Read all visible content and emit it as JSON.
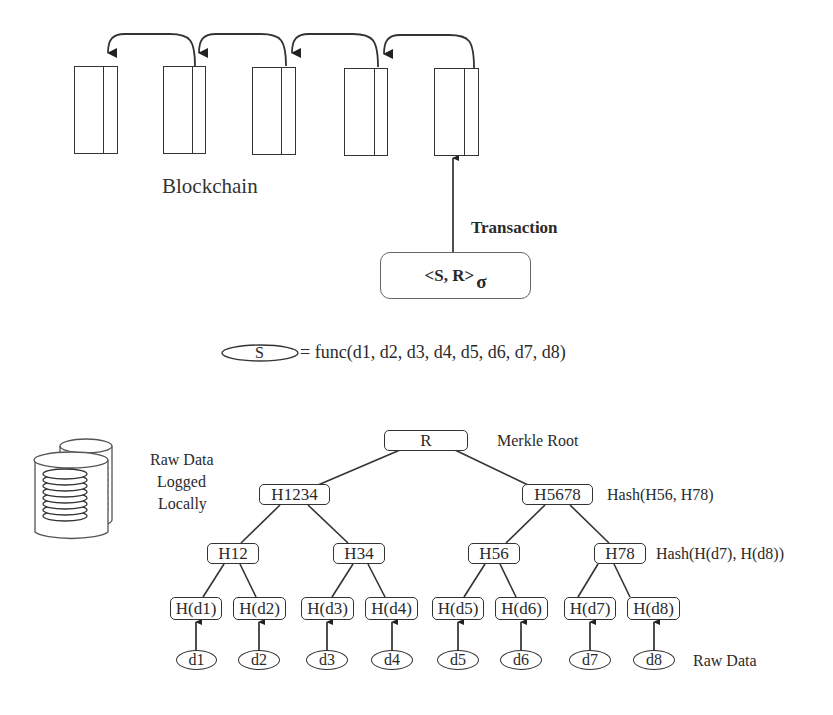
{
  "blockchain": {
    "label": "Blockchain",
    "blocks": [
      {
        "index": 1
      },
      {
        "index": 2
      },
      {
        "index": 3
      },
      {
        "index": 4
      },
      {
        "index": 5
      }
    ]
  },
  "transaction": {
    "label": "Transaction",
    "content": "<S, R>",
    "signature": "σ"
  },
  "formula": {
    "symbol": "S",
    "expression": "= func(d1, d2, d3, d4, d5, d6, d7, d8)"
  },
  "storage": {
    "icon": "database-icon",
    "label_lines": [
      "Raw Data",
      "Logged",
      "Locally"
    ]
  },
  "merkle_tree": {
    "root": {
      "label": "R",
      "annotation": "Merkle Root"
    },
    "level1": [
      {
        "label": "H1234"
      },
      {
        "label": "H5678",
        "annotation": "Hash(H56, H78)"
      }
    ],
    "level2": [
      {
        "label": "H12"
      },
      {
        "label": "H34"
      },
      {
        "label": "H56"
      },
      {
        "label": "H78",
        "annotation": "Hash(H(d7), H(d8))"
      }
    ],
    "leaf_hashes": [
      "H(d1)",
      "H(d2)",
      "H(d3)",
      "H(d4)",
      "H(d5)",
      "H(d6)",
      "H(d7)",
      "H(d8)"
    ],
    "raw_data": [
      "d1",
      "d2",
      "d3",
      "d4",
      "d5",
      "d6",
      "d7",
      "d8"
    ],
    "raw_data_annotation": "Raw Data"
  },
  "colors": {
    "stroke": "#333333",
    "text": "#2a2a2a",
    "tx_border": "#666666",
    "background": "#ffffff"
  }
}
